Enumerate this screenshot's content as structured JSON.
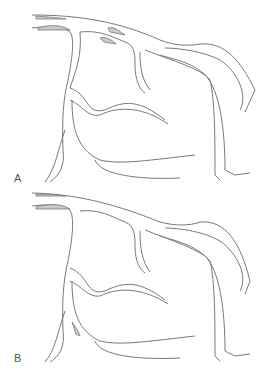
{
  "figure": {
    "panels": [
      {
        "label": "A",
        "description": "coronary artery tree, lesions at left main origin and proximal branches"
      },
      {
        "label": "B",
        "description": "coronary artery tree, lesion at ostium and distal branch"
      }
    ]
  }
}
